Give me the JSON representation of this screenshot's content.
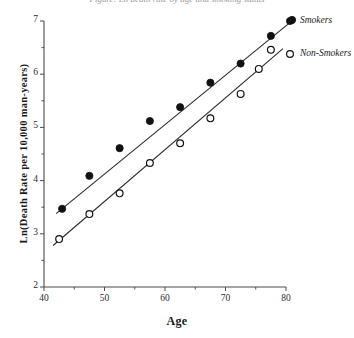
{
  "chart_data": {
    "type": "scatter",
    "title": "Figure: Ln death rate by age and smoking status",
    "xlabel": "Age",
    "ylabel": "Ln(Death Rate per 10,000 man-years)",
    "xlim": [
      40,
      80
    ],
    "ylim": [
      2,
      7
    ],
    "xticks": [
      40,
      50,
      60,
      70,
      80
    ],
    "xtick_labels": [
      "40",
      "50",
      "60",
      "70",
      "80"
    ],
    "xminor_ticks": [
      45,
      55,
      65,
      75
    ],
    "yticks": [
      2,
      3,
      4,
      5,
      6,
      7
    ],
    "ytick_labels": [
      "2",
      "3",
      "4",
      "5",
      "6",
      "7"
    ],
    "yminor_ticks": [
      2.5,
      3.5,
      4.5,
      5.5,
      6.5
    ],
    "grid": false,
    "legend_position": "right",
    "series": [
      {
        "name": "Smokers",
        "marker": "filled-circle",
        "x": [
          43,
          47.5,
          52.5,
          57.5,
          62.5,
          67.5,
          72.5,
          77.5,
          81
        ],
        "y": [
          3.47,
          4.09,
          4.61,
          5.12,
          5.38,
          5.84,
          6.2,
          6.72,
          7.02
        ],
        "fit_line": {
          "x": [
            42,
            81.5
          ],
          "y": [
            3.38,
            7.05
          ]
        }
      },
      {
        "name": "Non-Smokers",
        "marker": "open-circle",
        "x": [
          42.5,
          47.5,
          52.5,
          57.5,
          62.5,
          67.5,
          72.5,
          75.5,
          77.5
        ],
        "y": [
          2.9,
          3.37,
          3.76,
          4.33,
          4.7,
          5.17,
          5.63,
          6.1,
          6.46
        ],
        "fit_line": {
          "x": [
            41.5,
            79.5
          ],
          "y": [
            2.78,
            6.48
          ]
        }
      }
    ]
  },
  "legend": {
    "items": [
      {
        "label": "Smokers",
        "marker": "filled-circle"
      },
      {
        "label": "Non-Smokers",
        "marker": "open-circle"
      }
    ]
  }
}
